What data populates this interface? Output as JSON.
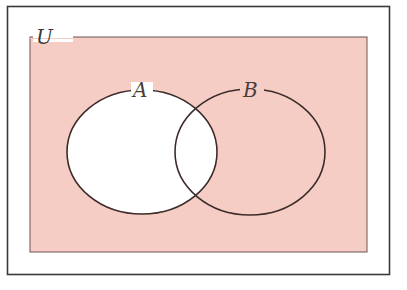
{
  "diagram": {
    "type": "venn",
    "universe_label": "U",
    "sets": [
      {
        "name": "A",
        "label": "A",
        "cx": 142,
        "cy": 152,
        "rx": 75,
        "ry": 62
      },
      {
        "name": "B",
        "label": "B",
        "cx": 250,
        "cy": 152,
        "rx": 75,
        "ry": 63
      }
    ],
    "shaded_region": "complement of A (U \\ A)",
    "colors": {
      "shade": "#f6cdc5",
      "unshaded": "#ffffff",
      "stroke": "#3b2c2a",
      "frame": "#3a3a3a"
    }
  }
}
